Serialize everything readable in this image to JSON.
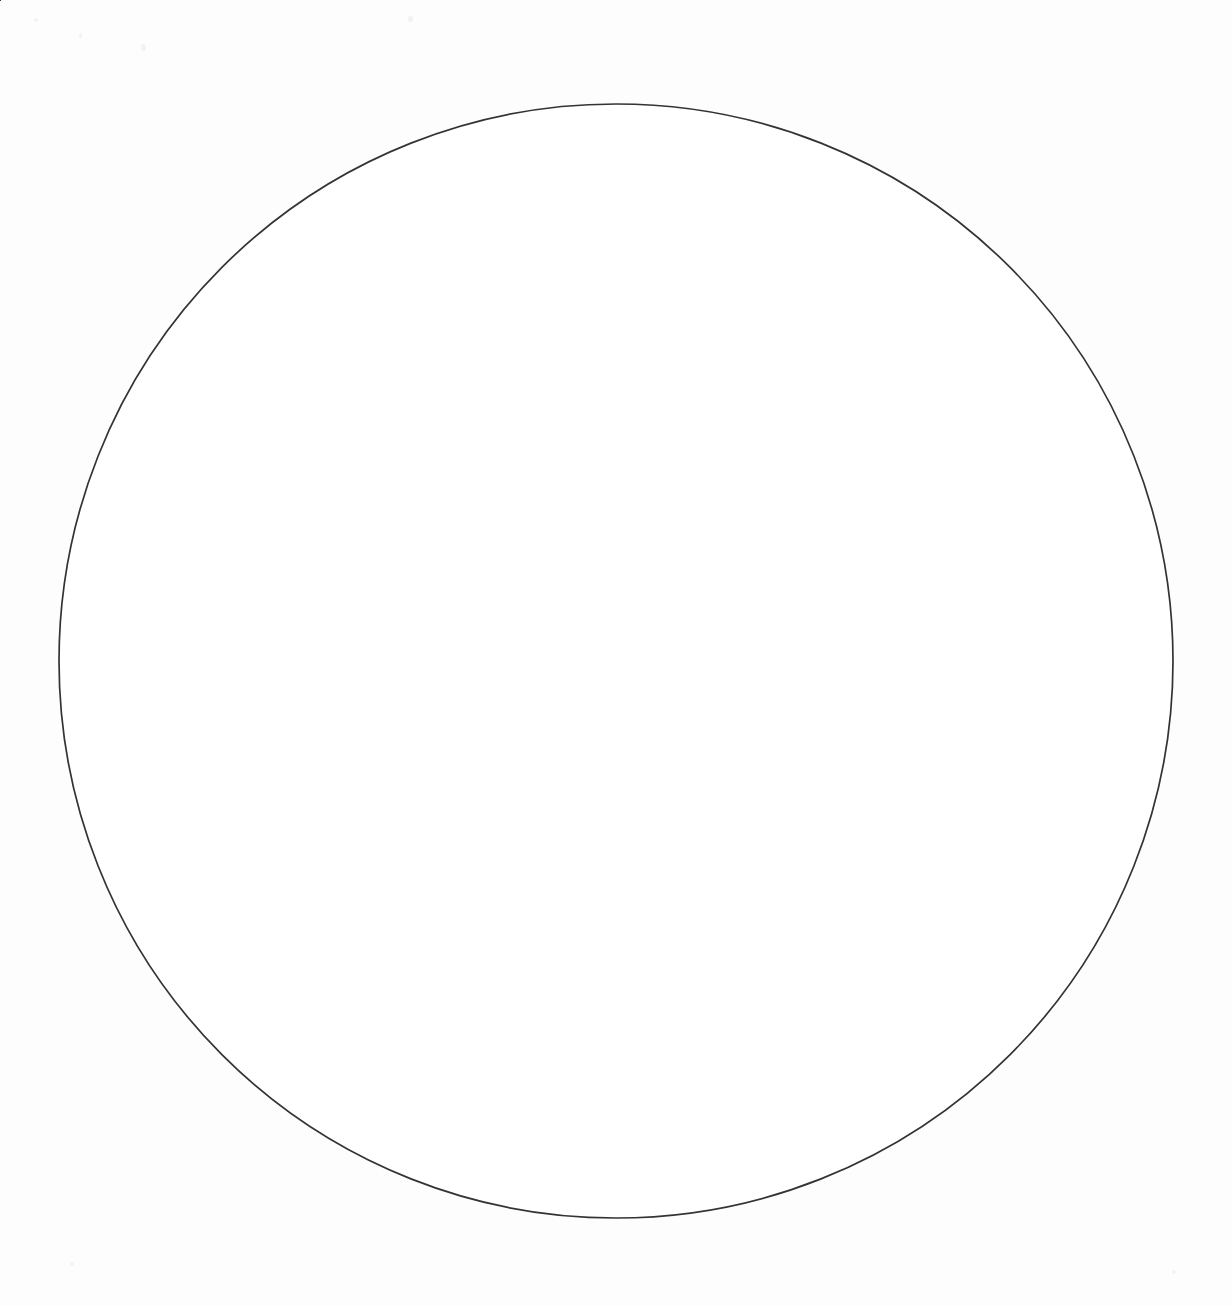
{
  "diagram": {
    "type": "pie-wheel",
    "shape": "circle",
    "sector_count": 8,
    "sector_angle_degrees": 45,
    "stroke_color": "#333333",
    "fill_color": "#ffffff",
    "background_color": "#fdfdfd",
    "text_color": "#141414",
    "center": {
      "x": 616,
      "y": 661
    },
    "radius": 557
  },
  "chart_data": {
    "type": "pie",
    "categories": [
      "Repeat",
      "Clarify",
      "Show Sequence",
      "Contrast",
      "Compare",
      "Emphasize a Point",
      "Add Information",
      "Show Time"
    ],
    "values": [
      12.5,
      12.5,
      12.5,
      12.5,
      12.5,
      12.5,
      12.5,
      12.5
    ],
    "xlabel": "",
    "ylabel": "",
    "legend": "none",
    "grid": false
  },
  "sectors": [
    {
      "label": "Repeat",
      "position": "top-right",
      "start_angle": 0,
      "end_angle": 45,
      "text_rotation": 22,
      "label_x": 800,
      "label_y": 205
    },
    {
      "label": "Clarify",
      "position": "right-upper",
      "start_angle": 45,
      "end_angle": 90,
      "text_rotation": 113,
      "label_x": 1046,
      "label_y": 466
    },
    {
      "label": "Show Sequence",
      "position": "right-lower",
      "start_angle": 90,
      "end_angle": 135,
      "text_rotation": 68,
      "label_x": 1040,
      "label_y": 840
    },
    {
      "label": "Contrast",
      "position": "bottom-right",
      "start_angle": 135,
      "end_angle": 180,
      "text_rotation": 203,
      "label_x": 800,
      "label_y": 1104
    },
    {
      "label": "Compare",
      "position": "bottom-left",
      "start_angle": 180,
      "end_angle": 225,
      "text_rotation": 158,
      "label_x": 431,
      "label_y": 1108
    },
    {
      "label": "Emphasize a Point",
      "position": "left-lower",
      "start_angle": 225,
      "end_angle": 270,
      "text_rotation": 292,
      "label_x": 215,
      "label_y": 836
    },
    {
      "label": "Add Information",
      "position": "left-upper",
      "start_angle": 270,
      "end_angle": 315,
      "text_rotation": 292,
      "label_x": 183,
      "label_y": 468
    },
    {
      "label": "Show Time",
      "position": "top-left",
      "start_angle": 315,
      "end_angle": 360,
      "text_rotation": 338,
      "label_x": 432,
      "label_y": 205
    }
  ],
  "divider_lines": [
    {
      "name": "vertical-diameter",
      "angle_degrees": 90
    },
    {
      "name": "horizontal-diameter",
      "angle_degrees": 0
    },
    {
      "name": "diagonal-diameter-ne-sw",
      "angle_degrees": 45
    },
    {
      "name": "diagonal-diameter-nw-se",
      "angle_degrees": 135
    }
  ]
}
